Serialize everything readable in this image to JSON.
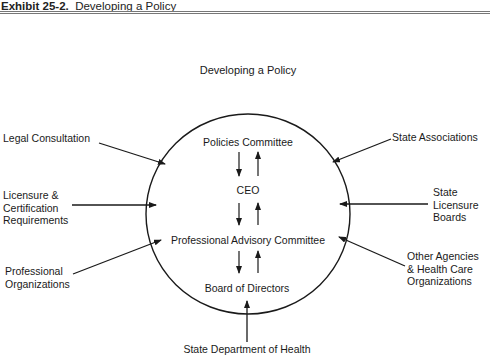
{
  "exhibit": {
    "number_label": "Exhibit 25-2.",
    "title": "Developing a Policy"
  },
  "diagram": {
    "title": "Developing a Policy",
    "internal_chain": [
      "Policies Committee",
      "CEO",
      "Professional Advisory Committee",
      "Board of Directors"
    ],
    "left_inputs": [
      {
        "line1": "Legal Consultation"
      },
      {
        "line1": "Licensure &",
        "line2": "Certification",
        "line3": "Requirements"
      },
      {
        "line1": "Professional",
        "line2": "Organizations"
      }
    ],
    "right_inputs": [
      {
        "line1": "State Associations"
      },
      {
        "line1": "State",
        "line2": "Licensure",
        "line3": "Boards"
      },
      {
        "line1": "Other Agencies",
        "line2": "& Health Care",
        "line3": "Organizations"
      }
    ],
    "bottom_input": "State Department of Health"
  }
}
